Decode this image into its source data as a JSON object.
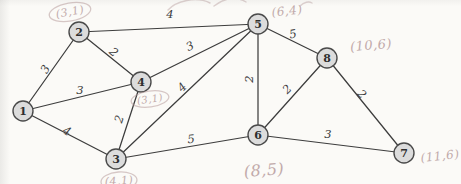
{
  "figure": {
    "type": "weighted-undirected-graph",
    "background": "#fbfaf7",
    "ink_color": "#3d3d3d",
    "pencil_color": "#b89d9d",
    "node_fill": "#dcdcdc",
    "node_stroke": "#4a4a4a",
    "node_radius": 10,
    "nodes": [
      {
        "id": "1",
        "x": 23,
        "y": 111
      },
      {
        "id": "2",
        "x": 79,
        "y": 32
      },
      {
        "id": "3",
        "x": 116,
        "y": 159
      },
      {
        "id": "4",
        "x": 141,
        "y": 82
      },
      {
        "id": "5",
        "x": 258,
        "y": 24
      },
      {
        "id": "6",
        "x": 258,
        "y": 135
      },
      {
        "id": "7",
        "x": 404,
        "y": 153
      },
      {
        "id": "8",
        "x": 327,
        "y": 58
      }
    ],
    "edges": [
      {
        "from": "1",
        "to": "2",
        "weight": "3",
        "lx": 45,
        "ly": 69,
        "rot": -60
      },
      {
        "from": "1",
        "to": "4",
        "weight": "3",
        "lx": 80,
        "ly": 90,
        "rot": 0
      },
      {
        "from": "1",
        "to": "3",
        "weight": "4",
        "lx": 67,
        "ly": 131,
        "rot": 28
      },
      {
        "from": "2",
        "to": "4",
        "weight": "2",
        "lx": 114,
        "ly": 52,
        "rot": 40
      },
      {
        "from": "2",
        "to": "5",
        "weight": "4",
        "lx": 170,
        "ly": 14,
        "rot": 0
      },
      {
        "from": "4",
        "to": "5",
        "weight": "3",
        "lx": 190,
        "ly": 46,
        "rot": -25
      },
      {
        "from": "3",
        "to": "4",
        "weight": "2",
        "lx": 119,
        "ly": 119,
        "rot": -72
      },
      {
        "from": "3",
        "to": "5",
        "weight": "4",
        "lx": 182,
        "ly": 87,
        "rot": -45
      },
      {
        "from": "3",
        "to": "6",
        "weight": "5",
        "lx": 191,
        "ly": 139,
        "rot": -5
      },
      {
        "from": "5",
        "to": "6",
        "weight": "2",
        "lx": 249,
        "ly": 79,
        "rot": -90
      },
      {
        "from": "5",
        "to": "8",
        "weight": "5",
        "lx": 293,
        "ly": 34,
        "rot": -10
      },
      {
        "from": "6",
        "to": "8",
        "weight": "2",
        "lx": 287,
        "ly": 89,
        "rot": -45
      },
      {
        "from": "6",
        "to": "7",
        "weight": "3",
        "lx": 328,
        "ly": 134,
        "rot": 0
      },
      {
        "from": "8",
        "to": "7",
        "weight": "2",
        "lx": 362,
        "ly": 94,
        "rot": 48
      }
    ],
    "pencil_labels": [
      {
        "text": "(3,1)",
        "x": 70,
        "y": 12,
        "rot": -10,
        "size": 11,
        "circled": true,
        "rx": 21,
        "ry": 9
      },
      {
        "text": "(6,4)",
        "x": 287,
        "y": 11,
        "rot": -6,
        "size": 12,
        "circled": false,
        "rx": 0,
        "ry": 0
      },
      {
        "text": "(10,6)",
        "x": 371,
        "y": 45,
        "rot": -5,
        "size": 13,
        "circled": false,
        "rx": 0,
        "ry": 0
      },
      {
        "text": "(3,1)",
        "x": 150,
        "y": 99,
        "rot": -8,
        "size": 10,
        "circled": true,
        "rx": 19,
        "ry": 8
      },
      {
        "text": "(8,5)",
        "x": 264,
        "y": 170,
        "rot": -4,
        "size": 16,
        "circled": false,
        "rx": 0,
        "ry": 0
      },
      {
        "text": "(4,1)",
        "x": 119,
        "y": 181,
        "rot": -4,
        "size": 11,
        "circled": true,
        "rx": 18,
        "ry": 9
      },
      {
        "text": "(11,6)",
        "x": 440,
        "y": 156,
        "rot": -6,
        "size": 12,
        "circled": false,
        "rx": 0,
        "ry": 0
      }
    ],
    "stray_pencil_marks": [
      "M168,10 C176,1 196,-4 210,3",
      "M214,6 C224,-2 236,-4 246,2",
      "M300,6 C304,2 309,1 312,3"
    ]
  }
}
